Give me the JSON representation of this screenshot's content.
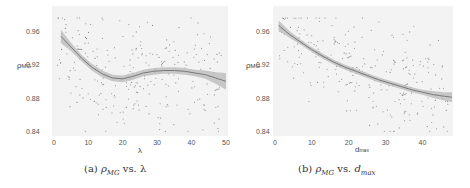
{
  "chart_data": [
    {
      "type": "scatter",
      "subtitle": "(a) ρMG vs. λ",
      "caption_label": "(a)",
      "caption_y": "ρ",
      "caption_y_sub": "MG",
      "caption_vs": "vs.",
      "caption_x": "λ",
      "xlabel": "λ",
      "ylabel": "ρMG",
      "ylabel_main": "ρ",
      "ylabel_sub": "MG",
      "xlim": [
        0,
        50
      ],
      "ylim": [
        0.84,
        0.98
      ],
      "xticks": [
        "0",
        "10",
        "20",
        "30",
        "40",
        "50"
      ],
      "yticks": [
        "0.96",
        "0.92",
        "0.88",
        "0.84"
      ],
      "grid": false,
      "trend": {
        "type": "loess",
        "x": [
          2,
          5,
          8,
          11,
          14,
          17,
          20,
          23,
          26,
          29,
          32,
          35,
          38,
          41,
          44,
          47,
          50
        ],
        "y": [
          0.956,
          0.943,
          0.93,
          0.919,
          0.911,
          0.906,
          0.905,
          0.908,
          0.912,
          0.914,
          0.915,
          0.915,
          0.914,
          0.912,
          0.91,
          0.906,
          0.902
        ],
        "ci_halfwidth": [
          0.008,
          0.005,
          0.004,
          0.004,
          0.004,
          0.004,
          0.004,
          0.004,
          0.004,
          0.004,
          0.004,
          0.004,
          0.004,
          0.004,
          0.005,
          0.007,
          0.01
        ]
      }
    },
    {
      "type": "scatter",
      "subtitle": "(b) ρMG vs. dmax",
      "caption_label": "(b)",
      "caption_y": "ρ",
      "caption_y_sub": "MG",
      "caption_vs": "vs.",
      "caption_x": "d",
      "caption_x_sub": "max",
      "xlabel": "dmax",
      "xlabel_main": "d",
      "xlabel_sub": "max",
      "ylabel": "ρMG",
      "ylabel_main": "ρ",
      "ylabel_sub": "MG",
      "xlim": [
        0,
        48
      ],
      "ylim": [
        0.84,
        0.98
      ],
      "xticks": [
        "0",
        "10",
        "20",
        "30",
        "40"
      ],
      "yticks": [
        "0.96",
        "0.92",
        "0.88",
        "0.84"
      ],
      "grid": false,
      "trend": {
        "type": "loess",
        "x": [
          1,
          4,
          7,
          10,
          13,
          16,
          19,
          22,
          25,
          28,
          31,
          34,
          37,
          40,
          43,
          46,
          48
        ],
        "y": [
          0.969,
          0.958,
          0.949,
          0.94,
          0.932,
          0.925,
          0.919,
          0.914,
          0.909,
          0.904,
          0.9,
          0.896,
          0.892,
          0.889,
          0.886,
          0.884,
          0.883
        ],
        "ci_halfwidth": [
          0.006,
          0.004,
          0.003,
          0.003,
          0.003,
          0.003,
          0.003,
          0.003,
          0.003,
          0.003,
          0.003,
          0.003,
          0.003,
          0.003,
          0.004,
          0.005,
          0.006
        ]
      }
    }
  ]
}
